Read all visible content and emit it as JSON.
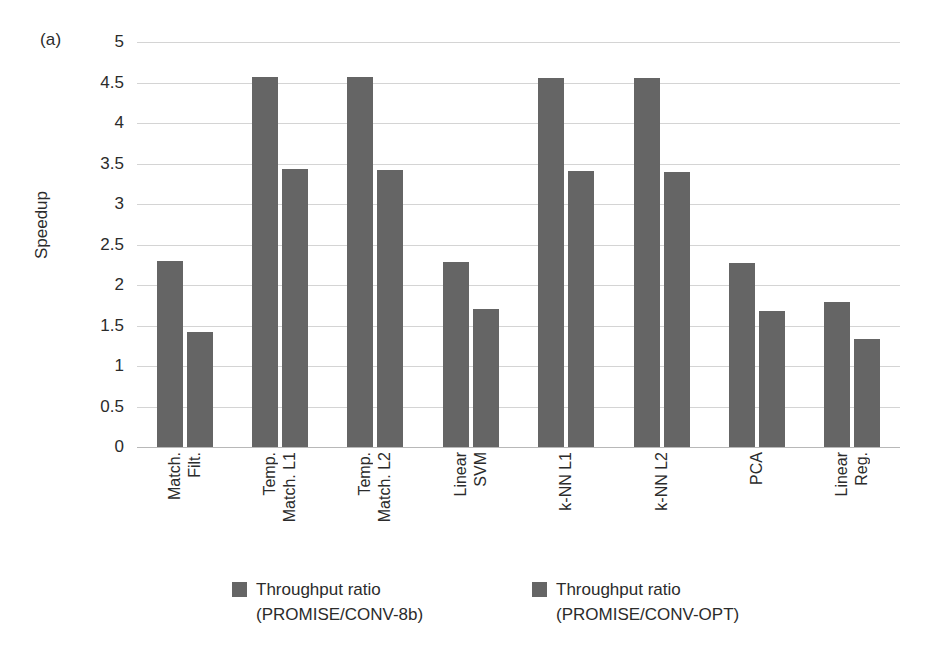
{
  "panel_label": "(a)",
  "chart_data": {
    "type": "bar",
    "title": "",
    "xlabel": "",
    "ylabel": "Speedup",
    "ylim": [
      0,
      5
    ],
    "yticks": [
      "0",
      "0.5",
      "1",
      "1.5",
      "2",
      "2.5",
      "3",
      "3.5",
      "4",
      "4.5",
      "5"
    ],
    "ytick_values": [
      0,
      0.5,
      1,
      1.5,
      2,
      2.5,
      3,
      3.5,
      4,
      4.5,
      5
    ],
    "grid": true,
    "legend_position": "bottom",
    "bar_color": "#656565",
    "categories": [
      "Match. Filt.",
      "Temp. Match. L1",
      "Temp. Match. L2",
      "Linear SVM",
      "k-NN L1",
      "k-NN L2",
      "PCA",
      "Linear Reg."
    ],
    "category_lines": [
      [
        "Match.",
        "Filt."
      ],
      [
        "Temp.",
        "Match. L1"
      ],
      [
        "Temp.",
        "Match. L2"
      ],
      [
        "Linear",
        "SVM"
      ],
      [
        "k-NN L1"
      ],
      [
        "k-NN L2"
      ],
      [
        "PCA"
      ],
      [
        "Linear",
        "Reg."
      ]
    ],
    "series": [
      {
        "name": "Throughput ratio (PROMISE/CONV-8b)",
        "label_lines": [
          "Throughput ratio",
          "(PROMISE/CONV-8b)"
        ],
        "color": "#656565",
        "values": [
          2.3,
          4.57,
          4.57,
          2.29,
          4.55,
          4.55,
          2.27,
          1.79
        ]
      },
      {
        "name": "Throughput ratio (PROMISE/CONV-OPT)",
        "label_lines": [
          "Throughput ratio",
          "(PROMISE/CONV-OPT)"
        ],
        "color": "#656565",
        "values": [
          1.42,
          3.43,
          3.42,
          1.7,
          3.41,
          3.4,
          1.68,
          1.33
        ]
      }
    ]
  }
}
